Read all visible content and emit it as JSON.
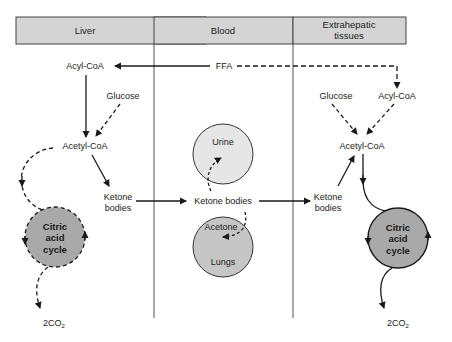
{
  "columns": [
    {
      "name": "liver",
      "header": "Liver"
    },
    {
      "name": "blood",
      "header": "Blood"
    },
    {
      "name": "extrahepatic",
      "header_line1": "Extrahepatic",
      "header_line2": "tissues"
    }
  ],
  "liver": {
    "acyl_coa": "Acyl-CoA",
    "glucose": "Glucose",
    "acetyl_coa": "Acetyl-CoA",
    "ketone_line1": "Ketone",
    "ketone_line2": "bodies",
    "cycle_line1": "Citric",
    "cycle_line2": "acid",
    "cycle_line3": "cycle",
    "co2": "2CO",
    "co2_sub": "2"
  },
  "blood": {
    "ffa": "FFA",
    "urine": "Urine",
    "ketone_bodies": "Ketone bodies",
    "acetone": "Acetone",
    "lungs": "Lungs"
  },
  "extrahepatic": {
    "glucose": "Glucose",
    "acyl_coa": "Acyl-CoA",
    "acetyl_coa": "Acetyl-CoA",
    "ketone_line1": "Ketone",
    "ketone_line2": "bodies",
    "cycle_line1": "Citric",
    "cycle_line2": "acid",
    "cycle_line3": "cycle",
    "co2": "2CO",
    "co2_sub": "2"
  },
  "colors": {
    "header_fill": "#d4d4d4",
    "cycle_fill": "#a9a9a9",
    "urine_fill": "#e6e6e6",
    "lungs_fill": "#c6c6c6",
    "line": "#1a1a1a",
    "divider": "#555555"
  }
}
